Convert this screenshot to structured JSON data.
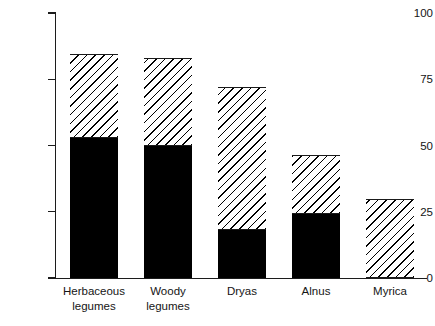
{
  "chart_data": {
    "type": "bar",
    "stacked": true,
    "title": "",
    "xlabel": "",
    "ylabel": "Occurrence (%)",
    "ylim": [
      0,
      100
    ],
    "yticks": [
      0,
      25,
      50,
      75,
      100
    ],
    "ytick_labels": [
      "0",
      "25",
      "50",
      "75",
      "100"
    ],
    "grid": false,
    "legend": "none",
    "categories": [
      "Herbaceous legumes",
      "Woody legumes",
      "Dryas",
      "Alnus",
      "Myrica"
    ],
    "category_lines": [
      [
        "Herbaceous",
        "legumes"
      ],
      [
        "Woody",
        "legumes"
      ],
      [
        "Dryas"
      ],
      [
        "Alnus"
      ],
      [
        "Myrica"
      ]
    ],
    "series": [
      {
        "name": "solid-black",
        "fill": "solid",
        "color": "#000000",
        "values": [
          53,
          50,
          18,
          24,
          0
        ]
      },
      {
        "name": "hatched",
        "fill": "diagonal-hatch",
        "color": "#000000",
        "values": [
          31.5,
          33,
          54,
          22.5,
          30
        ]
      },
      {
        "name": "open-white",
        "fill": "open",
        "color": "#ffffff",
        "values": [
          15.5,
          17,
          28,
          53.5,
          70
        ]
      }
    ],
    "cumulative_tops": {
      "solid-black": [
        53,
        50,
        18,
        24,
        0
      ],
      "hatched": [
        84.5,
        83,
        72,
        46.5,
        30
      ],
      "open-white": [
        100,
        100,
        100,
        100,
        100
      ]
    }
  },
  "axis": {
    "y_title": "Occurrence (%)"
  }
}
